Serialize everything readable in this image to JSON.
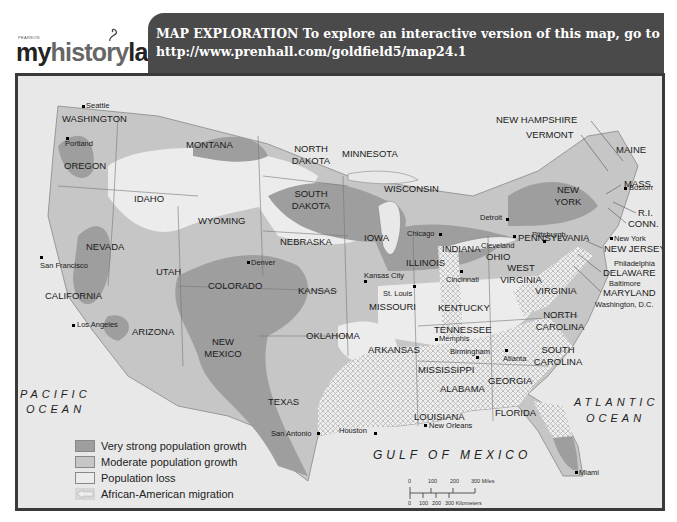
{
  "header": {
    "logo": {
      "publisher": "PEARSON",
      "brand_dark_1": "my",
      "brand_light": "history",
      "brand_dark_2": "lab"
    },
    "title_line1": "MAP EXPLORATION  To explore an interactive version of this map, go to",
    "title_line2": "http://www.prenhall.com/goldfield5/map24.1"
  },
  "colors": {
    "very_strong_growth": "#9e9e9e",
    "moderate_growth": "#c4c4c4",
    "population_loss": "#ececec",
    "water": "#e6e6e6",
    "header_band": "#4a4a4a",
    "frame": "#3a3a3a"
  },
  "states": [
    {
      "name": "WASHINGTON"
    },
    {
      "name": "OREGON"
    },
    {
      "name": "CALIFORNIA"
    },
    {
      "name": "NEVADA"
    },
    {
      "name": "IDAHO"
    },
    {
      "name": "MONTANA"
    },
    {
      "name": "WYOMING"
    },
    {
      "name": "UTAH"
    },
    {
      "name": "ARIZONA"
    },
    {
      "name": "COLORADO"
    },
    {
      "name": "NEW MEXICO"
    },
    {
      "name": "NORTH DAKOTA"
    },
    {
      "name": "SOUTH DAKOTA"
    },
    {
      "name": "NEBRASKA"
    },
    {
      "name": "KANSAS"
    },
    {
      "name": "OKLAHOMA"
    },
    {
      "name": "TEXAS"
    },
    {
      "name": "MINNESOTA"
    },
    {
      "name": "IOWA"
    },
    {
      "name": "MISSOURI"
    },
    {
      "name": "ARKANSAS"
    },
    {
      "name": "LOUISIANA"
    },
    {
      "name": "WISCONSIN"
    },
    {
      "name": "ILLINOIS"
    },
    {
      "name": "INDIANA"
    },
    {
      "name": "OHIO"
    },
    {
      "name": "KENTUCKY"
    },
    {
      "name": "TENNESSEE"
    },
    {
      "name": "MISSISSIPPI"
    },
    {
      "name": "ALABAMA"
    },
    {
      "name": "GEORGIA"
    },
    {
      "name": "FLORIDA"
    },
    {
      "name": "SOUTH CAROLINA"
    },
    {
      "name": "NORTH CAROLINA"
    },
    {
      "name": "VIRGINIA"
    },
    {
      "name": "WEST VIRGINIA"
    },
    {
      "name": "PENNSYLVANIA"
    },
    {
      "name": "NEW YORK"
    },
    {
      "name": "VERMONT"
    },
    {
      "name": "NEW HAMPSHIRE"
    },
    {
      "name": "MAINE"
    },
    {
      "name": "MASS."
    },
    {
      "name": "R.I."
    },
    {
      "name": "CONN."
    },
    {
      "name": "NEW JERSEY"
    },
    {
      "name": "DELAWARE"
    },
    {
      "name": "MARYLAND"
    }
  ],
  "cities": [
    {
      "name": "Seattle"
    },
    {
      "name": "Portland"
    },
    {
      "name": "San Francisco"
    },
    {
      "name": "Los Angeles"
    },
    {
      "name": "Denver"
    },
    {
      "name": "Kansas City"
    },
    {
      "name": "St. Louis"
    },
    {
      "name": "Chicago"
    },
    {
      "name": "Detroit"
    },
    {
      "name": "Cleveland"
    },
    {
      "name": "Pittsburgh"
    },
    {
      "name": "Cincinnati"
    },
    {
      "name": "Memphis"
    },
    {
      "name": "Birmingham"
    },
    {
      "name": "Atlanta"
    },
    {
      "name": "New Orleans"
    },
    {
      "name": "Houston"
    },
    {
      "name": "San Antonio"
    },
    {
      "name": "Miami"
    },
    {
      "name": "New York"
    },
    {
      "name": "Boston"
    },
    {
      "name": "Philadelphia"
    },
    {
      "name": "Baltimore"
    },
    {
      "name": "Washington, D.C."
    }
  ],
  "water_bodies": {
    "pacific_1": "PACIFIC",
    "pacific_2": "OCEAN",
    "atlantic_1": "ATLANTIC",
    "atlantic_2": "OCEAN",
    "gulf": "GULF OF MEXICO"
  },
  "legend": [
    {
      "label": "Very strong population growth"
    },
    {
      "label": "Moderate population growth"
    },
    {
      "label": "Population loss"
    },
    {
      "label": "African-American migration"
    }
  ],
  "scale": {
    "miles_ticks": [
      "0",
      "100",
      "200",
      "300 Miles"
    ],
    "km_ticks": [
      "0",
      "100",
      "200",
      "300 Kilometers"
    ]
  }
}
